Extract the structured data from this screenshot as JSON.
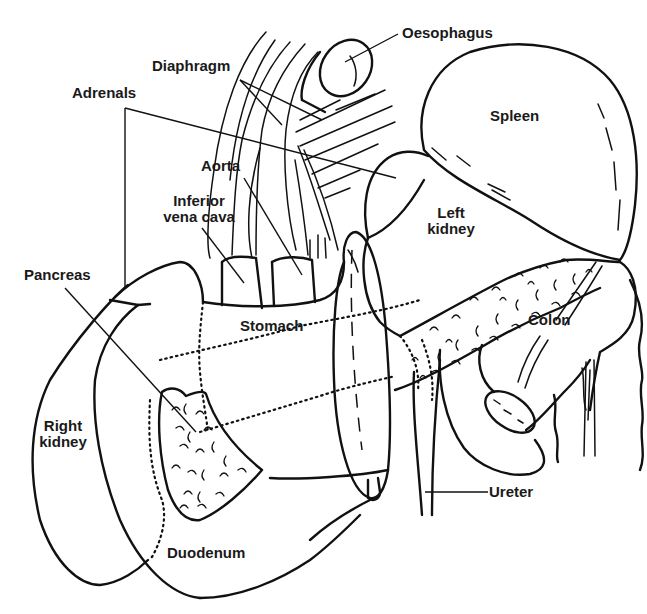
{
  "diagram": {
    "type": "anatomical line drawing",
    "colors": {
      "ink": "#111111",
      "background": "#ffffff"
    },
    "labels": [
      {
        "id": "oesophagus",
        "text": "Oesophagus"
      },
      {
        "id": "diaphragm",
        "text": "Diaphragm"
      },
      {
        "id": "adrenals",
        "text": "Adrenals"
      },
      {
        "id": "spleen",
        "text": "Spleen"
      },
      {
        "id": "aorta",
        "text": "Aorta"
      },
      {
        "id": "inferior_vena_cava",
        "text": "Inferior vena cava",
        "lines": [
          "Inferior",
          "vena cava"
        ]
      },
      {
        "id": "left_kidney",
        "text": "Left kidney",
        "lines": [
          "Left",
          "kidney"
        ]
      },
      {
        "id": "pancreas",
        "text": "Pancreas"
      },
      {
        "id": "stomach",
        "text": "Stomach"
      },
      {
        "id": "colon",
        "text": "Colon"
      },
      {
        "id": "right_kidney",
        "text": "Right kidney",
        "lines": [
          "Right",
          "kidney"
        ]
      },
      {
        "id": "ureter",
        "text": "Ureter"
      },
      {
        "id": "duodenum",
        "text": "Duodenum"
      }
    ]
  }
}
